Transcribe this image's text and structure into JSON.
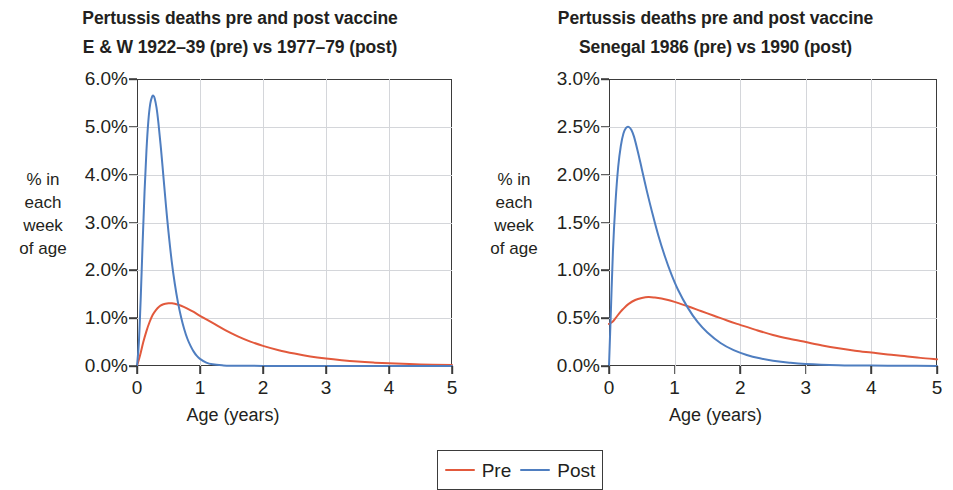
{
  "figure": {
    "xaxis_title": "Age (years)",
    "yaxis_title_lines": [
      "% in",
      "each",
      "week",
      "of age"
    ],
    "legend": {
      "pre": {
        "label": "Pre",
        "color": "#e2593c"
      },
      "post": {
        "label": "Post",
        "color": "#4f7ec0"
      }
    }
  },
  "chart_data": [
    {
      "type": "line",
      "panel": "left",
      "title": "Pertussis deaths pre and post vaccine",
      "subtitle": "E & W 1922–39 (pre) vs 1977–79 (post)",
      "xlabel": "Age (years)",
      "ylabel": "% in each week of age",
      "xlim": [
        0,
        5
      ],
      "ylim": [
        0,
        6
      ],
      "xticks": [
        0,
        1,
        2,
        3,
        4,
        5
      ],
      "xtick_labels": [
        "0",
        "1",
        "2",
        "3",
        "4",
        "5"
      ],
      "yticks": [
        0,
        1,
        2,
        3,
        4,
        5,
        6
      ],
      "ytick_labels": [
        "0.0%",
        "1.0%",
        "2.0%",
        "3.0%",
        "4.0%",
        "5.0%",
        "6.0%"
      ],
      "grid": true,
      "legend_position": "bottom-center-shared",
      "series": [
        {
          "name": "Pre",
          "color": "#e2593c",
          "peak": {
            "x": 0.55,
            "y": 1.31
          },
          "x": [
            0,
            0.05,
            0.1,
            0.15,
            0.2,
            0.25,
            0.3,
            0.35,
            0.4,
            0.45,
            0.5,
            0.55,
            0.6,
            0.7,
            0.8,
            0.9,
            1.0,
            1.2,
            1.4,
            1.6,
            1.8,
            2.0,
            2.25,
            2.5,
            2.75,
            3.0,
            3.25,
            3.5,
            3.75,
            4.0,
            4.5,
            5.0
          ],
          "values": [
            0.0,
            0.23,
            0.5,
            0.73,
            0.92,
            1.07,
            1.17,
            1.24,
            1.28,
            1.3,
            1.31,
            1.31,
            1.3,
            1.26,
            1.2,
            1.13,
            1.05,
            0.9,
            0.75,
            0.62,
            0.51,
            0.42,
            0.33,
            0.26,
            0.2,
            0.155,
            0.12,
            0.092,
            0.071,
            0.055,
            0.033,
            0.02
          ]
        },
        {
          "name": "Post",
          "color": "#4f7ec0",
          "peak": {
            "x": 0.26,
            "y": 5.65
          },
          "x": [
            0,
            0.03,
            0.06,
            0.09,
            0.12,
            0.15,
            0.18,
            0.21,
            0.24,
            0.26,
            0.28,
            0.31,
            0.34,
            0.38,
            0.42,
            0.46,
            0.5,
            0.55,
            0.6,
            0.65,
            0.7,
            0.75,
            0.8,
            0.85,
            0.9,
            0.95,
            1.0,
            1.1,
            1.2,
            1.35,
            1.5,
            2.0,
            3.0,
            4.0,
            5.0
          ],
          "values": [
            0.0,
            0.5,
            1.45,
            2.6,
            3.65,
            4.5,
            5.12,
            5.48,
            5.63,
            5.65,
            5.6,
            5.4,
            5.08,
            4.55,
            3.95,
            3.35,
            2.8,
            2.2,
            1.72,
            1.33,
            1.02,
            0.77,
            0.57,
            0.42,
            0.3,
            0.21,
            0.15,
            0.07,
            0.035,
            0.015,
            0.007,
            0.002,
            0.0,
            0.0,
            0.0
          ]
        }
      ]
    },
    {
      "type": "line",
      "panel": "right",
      "title": "Pertussis deaths pre and post vaccine",
      "subtitle": "Senegal 1986 (pre) vs 1990 (post)",
      "xlabel": "Age (years)",
      "ylabel": "% in each week of age",
      "xlim": [
        0,
        5
      ],
      "ylim": [
        0,
        3
      ],
      "xticks": [
        0,
        1,
        2,
        3,
        4,
        5
      ],
      "xtick_labels": [
        "0",
        "1",
        "2",
        "3",
        "4",
        "5"
      ],
      "yticks": [
        0,
        0.5,
        1.0,
        1.5,
        2.0,
        2.5,
        3.0
      ],
      "ytick_labels": [
        "0.0%",
        "0.5%",
        "1.0%",
        "1.5%",
        "2.0%",
        "2.5%",
        "3.0%"
      ],
      "grid": true,
      "legend_position": "bottom-center-shared",
      "series": [
        {
          "name": "Pre",
          "color": "#e2593c",
          "peak": {
            "x": 0.62,
            "y": 0.72
          },
          "x": [
            0,
            0.05,
            0.1,
            0.15,
            0.2,
            0.25,
            0.3,
            0.4,
            0.5,
            0.6,
            0.7,
            0.8,
            0.9,
            1.0,
            1.2,
            1.4,
            1.6,
            1.8,
            2.0,
            2.25,
            2.5,
            2.75,
            3.0,
            3.25,
            3.5,
            3.75,
            4.0,
            4.25,
            4.5,
            4.75,
            5.0
          ],
          "values": [
            0.44,
            0.46,
            0.5,
            0.545,
            0.585,
            0.62,
            0.65,
            0.69,
            0.71,
            0.72,
            0.715,
            0.705,
            0.69,
            0.67,
            0.625,
            0.575,
            0.525,
            0.475,
            0.43,
            0.375,
            0.325,
            0.285,
            0.25,
            0.215,
            0.185,
            0.16,
            0.14,
            0.12,
            0.105,
            0.085,
            0.07
          ]
        },
        {
          "name": "Post",
          "color": "#4f7ec0",
          "peak": {
            "x": 0.3,
            "y": 2.5
          },
          "x": [
            0,
            0.03,
            0.06,
            0.1,
            0.14,
            0.18,
            0.22,
            0.26,
            0.3,
            0.34,
            0.38,
            0.44,
            0.5,
            0.58,
            0.66,
            0.75,
            0.85,
            0.95,
            1.05,
            1.2,
            1.35,
            1.5,
            1.7,
            1.9,
            2.1,
            2.3,
            2.5,
            2.75,
            3.0,
            3.5,
            4.0,
            4.5,
            5.0
          ],
          "values": [
            0.0,
            0.6,
            1.2,
            1.72,
            2.08,
            2.3,
            2.43,
            2.49,
            2.5,
            2.47,
            2.4,
            2.24,
            2.06,
            1.82,
            1.6,
            1.37,
            1.15,
            0.96,
            0.8,
            0.61,
            0.46,
            0.35,
            0.24,
            0.165,
            0.115,
            0.08,
            0.055,
            0.034,
            0.021,
            0.009,
            0.004,
            0.002,
            0.001
          ]
        }
      ]
    }
  ]
}
